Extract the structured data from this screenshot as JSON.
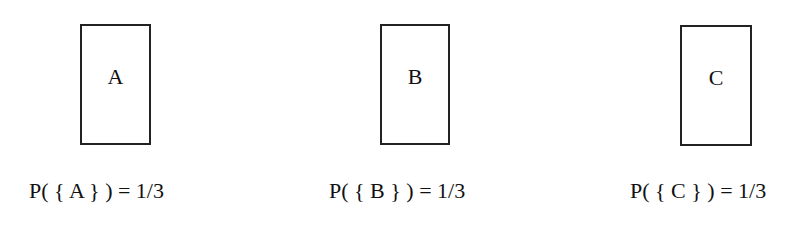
{
  "outcomes": [
    {
      "label": "A",
      "probability_text": "P( { A } ) =  1/3"
    },
    {
      "label": "B",
      "probability_text": "P( { B } ) =  1/3"
    },
    {
      "label": "C",
      "probability_text": "P( { C } ) =  1/3"
    }
  ]
}
